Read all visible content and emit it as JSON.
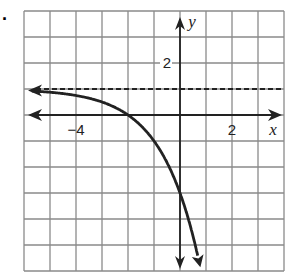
{
  "problem_marker": ".",
  "chart_data": {
    "type": "line",
    "title": "",
    "xlabel": "x",
    "ylabel": "y",
    "xlim": [
      -6,
      4
    ],
    "ylim": [
      -6,
      4
    ],
    "grid": true,
    "tick_labels": {
      "x": [
        {
          "value": -4,
          "label": "−4"
        },
        {
          "value": 2,
          "label": "2"
        }
      ],
      "y": [
        {
          "value": 2,
          "label": "2"
        }
      ]
    },
    "asymptote": {
      "type": "horizontal",
      "y": 1,
      "style": "dashed"
    },
    "series": [
      {
        "name": "f(x)",
        "description": "Exponential curve approaching y=1 on the left, decreasing steeply to the right",
        "x": [
          -6,
          -5,
          -4,
          -3,
          -2.5,
          -2,
          -1.5,
          -1,
          -0.5,
          -0.3
        ],
        "y": [
          0.94,
          0.88,
          0.75,
          0.5,
          0.29,
          0,
          -0.41,
          -1,
          -1.83,
          -5.6
        ]
      }
    ]
  },
  "colors": {
    "grid": "#8a8a8a",
    "axes": "#222222",
    "curve": "#222222",
    "background": "#ffffff"
  }
}
